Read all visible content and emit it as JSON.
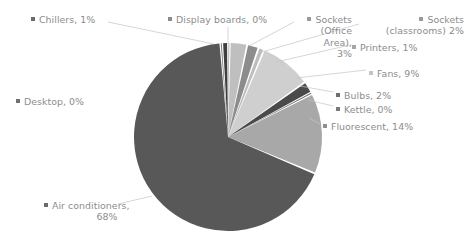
{
  "chart_data": {
    "type": "pie",
    "title": "",
    "subtitle": "",
    "xlabel": "",
    "ylabel": "",
    "grid": false,
    "legend_position": "data-labels-outside",
    "label_format": "{name}, {percent}%",
    "start_angle_deg": 0,
    "direction": "clockwise",
    "categories": [
      "Display boards",
      "Sockets (Office Area)",
      "Sockets (classrooms)",
      "Printers",
      "Fans",
      "Bulbs",
      "Kettle",
      "Fluorescent",
      "Air conditioners",
      "Desktop",
      "Chillers"
    ],
    "values": [
      0,
      3,
      2,
      1,
      9,
      2,
      0,
      14,
      68,
      0,
      1
    ],
    "units": "percent",
    "colors": [
      "#a6a6a6",
      "#bfbfbf",
      "#8c8c8c",
      "#bdbdbd",
      "#cfcfcf",
      "#4a4a4a",
      "#6e6e6e",
      "#a8a8a8",
      "#585858",
      "#6b6b6b",
      "#3f3f3f"
    ],
    "slices": [
      {
        "name": "Display boards",
        "percent": 0,
        "color": "#a6a6a6",
        "marker": "#8c8c8c"
      },
      {
        "name": "Sockets (Office Area)",
        "percent": 3,
        "color": "#bfbfbf",
        "marker": "#9a9a9a"
      },
      {
        "name": "Sockets (classrooms)",
        "percent": 2,
        "color": "#8c8c8c",
        "marker": "#9a9a9a"
      },
      {
        "name": "Printers",
        "percent": 1,
        "color": "#bdbdbd",
        "marker": "#a6a6a6"
      },
      {
        "name": "Fans",
        "percent": 9,
        "color": "#cfcfcf",
        "marker": "#c4c4c4"
      },
      {
        "name": "Bulbs",
        "percent": 2,
        "color": "#4a4a4a",
        "marker": "#6e6e6e"
      },
      {
        "name": "Kettle",
        "percent": 0,
        "color": "#6e6e6e",
        "marker": "#7a7a7a"
      },
      {
        "name": "Fluorescent",
        "percent": 14,
        "color": "#a8a8a8",
        "marker": "#8f8f8f"
      },
      {
        "name": "Air conditioners",
        "percent": 68,
        "color": "#585858",
        "marker": "#6b6b6b"
      },
      {
        "name": "Desktop",
        "percent": 0,
        "color": "#6b6b6b",
        "marker": "#707070"
      },
      {
        "name": "Chillers",
        "percent": 1,
        "color": "#3f3f3f",
        "marker": "#6b6b6b"
      }
    ]
  },
  "labels": {
    "chillers": "Chillers, 1%",
    "display_boards": "Display boards, 0%",
    "sockets_office_l1": "Sockets",
    "sockets_office_l2": "(Office",
    "sockets_office_l3": "Area),",
    "sockets_office_l4": "3%",
    "sockets_classrooms_l1": "Sockets",
    "sockets_classrooms_l2": "(classrooms)  2%",
    "printers": "Printers, 1%",
    "fans": "Fans, 9%",
    "bulbs": "Bulbs, 2%",
    "kettle": "Kettle, 0%",
    "fluorescent": "Fluorescent, 14%",
    "desktop": "Desktop, 0%",
    "air_conditioners_l1": "Air conditioners,",
    "air_conditioners_l2": "68%"
  },
  "style": {
    "background": "#ffffff",
    "text_color": "#8c8c8c",
    "leader_line_color": "#bfbfbf",
    "slice_gap_color": "#ffffff"
  }
}
